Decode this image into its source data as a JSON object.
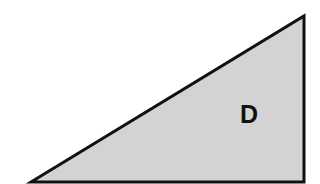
{
  "diagram": {
    "shape": "right-triangle",
    "label": "D",
    "fill_color": "#d3d3d3",
    "stroke_color": "#111111"
  }
}
